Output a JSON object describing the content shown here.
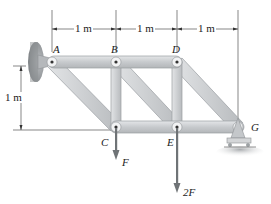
{
  "diagram": {
    "type": "truss",
    "joints": [
      {
        "id": "A",
        "label": "A",
        "x": 52,
        "y": 62
      },
      {
        "id": "B",
        "label": "B",
        "x": 116,
        "y": 62
      },
      {
        "id": "D",
        "label": "D",
        "x": 177,
        "y": 62
      },
      {
        "id": "C",
        "label": "C",
        "x": 116,
        "y": 127
      },
      {
        "id": "E",
        "label": "E",
        "x": 177,
        "y": 127
      },
      {
        "id": "G",
        "label": "G",
        "x": 238,
        "y": 127
      }
    ],
    "members": [
      [
        "A",
        "B"
      ],
      [
        "B",
        "D"
      ],
      [
        "C",
        "E"
      ],
      [
        "E",
        "G"
      ],
      [
        "A",
        "C"
      ],
      [
        "B",
        "E"
      ],
      [
        "D",
        "G"
      ],
      [
        "B",
        "C"
      ],
      [
        "D",
        "E"
      ]
    ],
    "supports": [
      {
        "joint": "A",
        "type": "pin-wall"
      },
      {
        "joint": "G",
        "type": "roller"
      }
    ],
    "loads": [
      {
        "joint": "C",
        "label": "F"
      },
      {
        "joint": "E",
        "label": "2F"
      }
    ],
    "dimensions": {
      "horizontal": [
        "1 m",
        "1 m",
        "1 m"
      ],
      "vertical": "1 m"
    },
    "colors": {
      "member": "#c9cccf",
      "member_edge": "#9a9ea2",
      "wall": "#8d9194",
      "ground": "#b9bcbf",
      "arrow": "#6f7376",
      "line": "#555555"
    }
  }
}
